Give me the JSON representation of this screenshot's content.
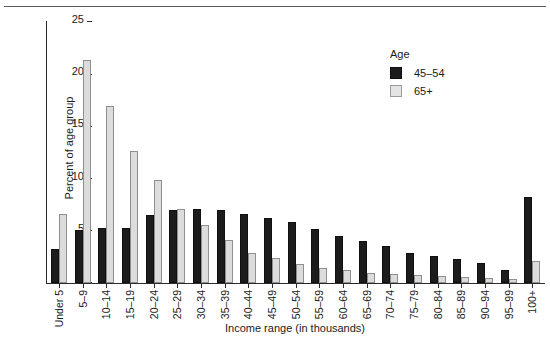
{
  "chart_data": {
    "type": "bar",
    "title": "",
    "xlabel": "Income range (in thousands)",
    "ylabel": "Percent of age group",
    "ylim": [
      0,
      25
    ],
    "yticks": [
      0,
      5,
      10,
      15,
      20,
      25
    ],
    "grid": false,
    "legend_title": "Age",
    "legend_position": "top-right inside plot",
    "categories": [
      "Under 5",
      "5–9",
      "10–14",
      "15–19",
      "20–24",
      "25–29",
      "30–34",
      "35–39",
      "40–44",
      "45–49",
      "50–54",
      "55–59",
      "60–64",
      "65–69",
      "70–74",
      "75–79",
      "80–84",
      "85–89",
      "90–94",
      "95–99",
      "100+"
    ],
    "series": [
      {
        "name": "45–54",
        "color": "#1c1c1c",
        "values": [
          3.3,
          5.1,
          5.3,
          5.3,
          6.5,
          7.0,
          7.1,
          7.0,
          6.6,
          6.2,
          5.8,
          5.2,
          4.5,
          4.0,
          3.5,
          2.9,
          2.6,
          2.3,
          1.9,
          1.2,
          8.2
        ]
      },
      {
        "name": "65+",
        "color": "#dcdcdc",
        "values": [
          6.6,
          21.4,
          17.0,
          12.6,
          9.9,
          7.1,
          5.6,
          4.1,
          2.9,
          2.4,
          1.8,
          1.4,
          1.2,
          1.0,
          0.9,
          0.8,
          0.7,
          0.6,
          0.5,
          0.4,
          2.1
        ]
      }
    ]
  },
  "axes": {
    "y_tick_labels": [
      "0",
      "5",
      "10",
      "15",
      "20",
      "25"
    ],
    "y_title": "Percent of age group",
    "x_title": "Income range (in thousands)"
  },
  "legend": {
    "title": "Age",
    "entries": [
      {
        "label": "45–54",
        "swatch": "dark"
      },
      {
        "label": "65+",
        "swatch": "light"
      }
    ]
  }
}
